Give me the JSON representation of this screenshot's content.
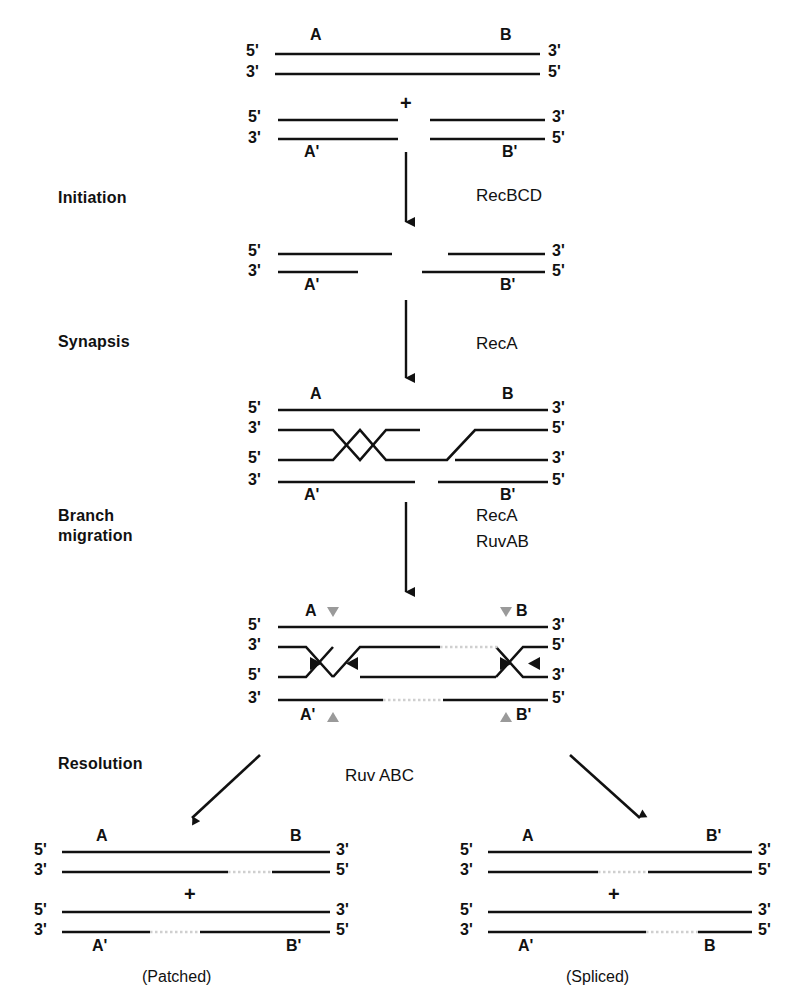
{
  "figure": {
    "background_color": "#ffffff",
    "stroke_color": "#111111",
    "heteroduplex_color": "#bdbdbd",
    "migration_marker_color": "#9a9a9a"
  },
  "stages": [
    {
      "id": "initiation",
      "label": "Initiation",
      "enzyme": "RecBCD"
    },
    {
      "id": "synapsis",
      "label": "Synapsis",
      "enzyme": "RecA"
    },
    {
      "id": "branch-migration",
      "label": "Branch\nmigration",
      "enzyme_line1": "RecA",
      "enzyme_line2": "RuvAB"
    },
    {
      "id": "resolution",
      "label": "Resolution",
      "enzyme": "Ruv ABC"
    }
  ],
  "ends": {
    "five_prime": "5'",
    "three_prime": "3'"
  },
  "segments": {
    "a": "A",
    "b": "B",
    "a_prime": "A'",
    "b_prime": "B'"
  },
  "plus": "+",
  "panels": {
    "substrate": {
      "name": "parental-duplexes",
      "top_duplex": {
        "left_label": "A",
        "right_label": "B",
        "left_end_top": "5'",
        "left_end_bottom": "3'",
        "right_end_top": "3'",
        "right_end_bottom": "5'"
      },
      "bottom_duplex": {
        "left_label": "A'",
        "right_label": "B'",
        "left_end_top": "5'",
        "left_end_bottom": "3'",
        "right_end_top": "3'",
        "right_end_bottom": "5'"
      }
    },
    "initiation_product": {
      "name": "recbcd-processed-duplex",
      "left_label": "A'",
      "right_label": "B'",
      "left_end_top": "5'",
      "left_end_bottom": "3'",
      "right_end_top": "3'",
      "right_end_bottom": "5'"
    },
    "synapsis_product": {
      "name": "joint-molecule",
      "labels": {
        "top_left": "A",
        "top_right": "B",
        "bottom_left": "A'",
        "bottom_right": "B'"
      },
      "left_ends": [
        "5'",
        "3'",
        "5'",
        "3'"
      ],
      "right_ends": [
        "3'",
        "5'",
        "3'",
        "5'"
      ]
    },
    "branch_migration_product": {
      "name": "holliday-junction",
      "labels": {
        "top_left": "A",
        "top_right": "B",
        "bottom_left": "A'",
        "bottom_right": "B'"
      },
      "left_ends": [
        "5'",
        "3'",
        "5'",
        "3'"
      ],
      "right_ends": [
        "3'",
        "5'",
        "3'",
        "5'"
      ]
    },
    "patched_product": {
      "name": "patched-recombinant",
      "caption": "(Patched)",
      "duplex_top": {
        "left_label": "A",
        "right_label": "B",
        "left_end_top": "5'",
        "left_end_bottom": "3'",
        "right_end_top": "3'",
        "right_end_bottom": "5'"
      },
      "duplex_bottom": {
        "left_label": "A'",
        "right_label": "B'",
        "left_end_top": "5'",
        "left_end_bottom": "3'",
        "right_end_top": "3'",
        "right_end_bottom": "5'"
      }
    },
    "spliced_product": {
      "name": "spliced-recombinant",
      "caption": "(Spliced)",
      "duplex_top": {
        "left_label": "A",
        "right_label": "B'",
        "left_end_top": "5'",
        "left_end_bottom": "3'",
        "right_end_top": "3'",
        "right_end_bottom": "5'"
      },
      "duplex_bottom": {
        "left_label": "A'",
        "right_label": "B",
        "left_end_top": "5'",
        "left_end_bottom": "3'",
        "right_end_top": "3'",
        "right_end_bottom": "5'"
      }
    }
  }
}
